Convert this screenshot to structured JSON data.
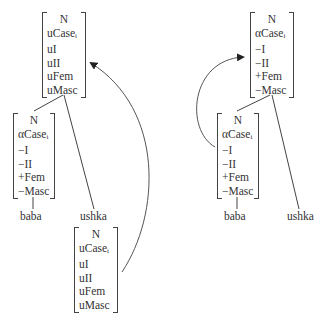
{
  "left_tree": {
    "root": {
      "rows": [
        "N",
        "uCase",
        "uI",
        "uII",
        "uFem",
        "uMasc"
      ],
      "subscript_row": 1,
      "subscript": "i"
    },
    "left_child": {
      "rows": [
        "N",
        "αCase",
        "−I",
        "−II",
        "+Fem",
        "−Masc"
      ],
      "subscript_row": 1,
      "subscript": "i"
    },
    "leaf_left": "baba",
    "leaf_right": "ushka",
    "moved": {
      "rows": [
        "N",
        "uCase",
        "uI",
        "uII",
        "uFem",
        "uMasc"
      ],
      "subscript_row": 1,
      "subscript": "i"
    }
  },
  "right_tree": {
    "root": {
      "rows": [
        "N",
        "αCase",
        "−I",
        "−II",
        "+Fem",
        "−Masc"
      ],
      "subscript_row": 1,
      "subscript": "i"
    },
    "left_child": {
      "rows": [
        "N",
        "αCase",
        "−I",
        "−II",
        "+Fem",
        "−Masc"
      ],
      "subscript_row": 1,
      "subscript": "i"
    },
    "leaf_left": "baba",
    "leaf_right": "ushka"
  },
  "colors": {
    "line": "#444444",
    "text": "#333333"
  }
}
